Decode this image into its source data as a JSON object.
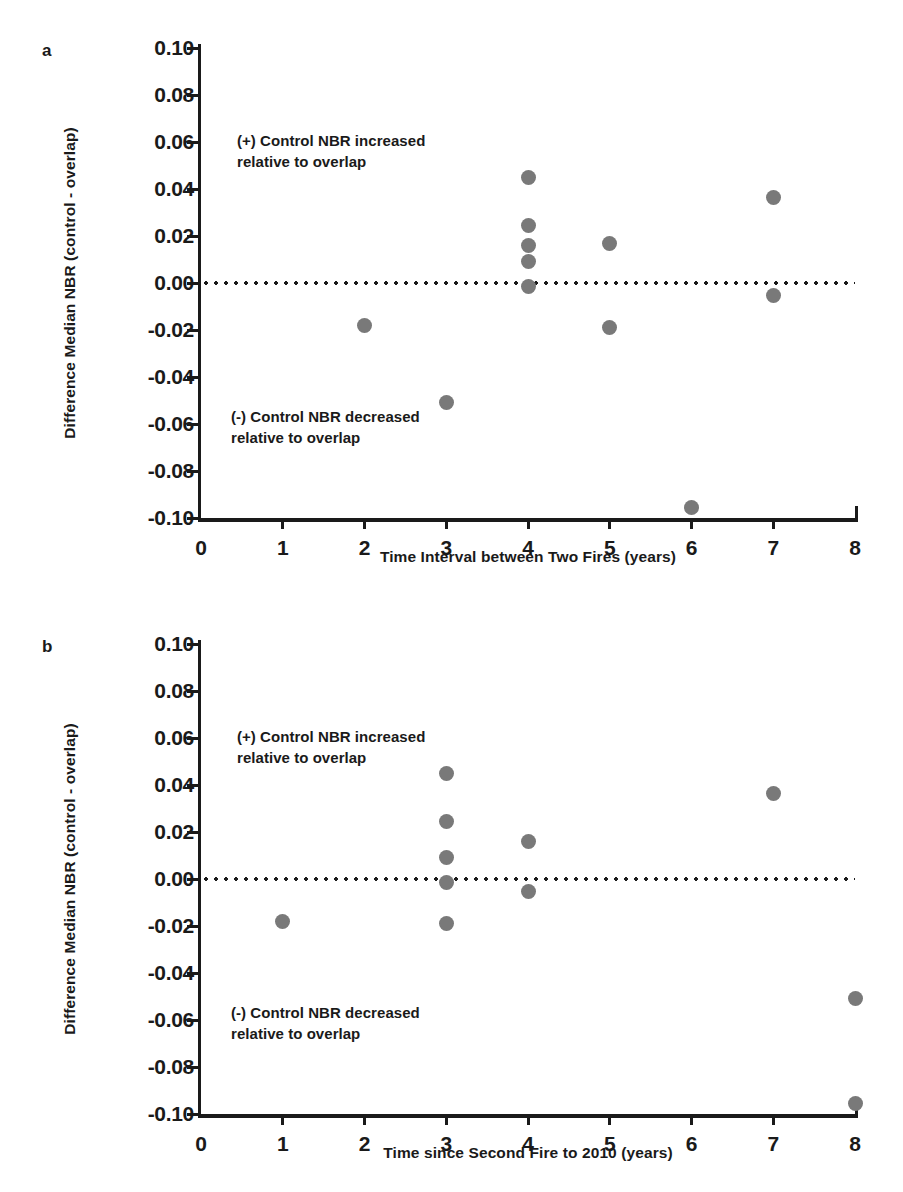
{
  "figure": {
    "background": "#ffffff",
    "dot_color": "#797979",
    "axis_color": "#1a1a1a"
  },
  "panels": [
    {
      "letter": "a",
      "annotation_positive": "(+) Control NBR increased\nrelative to overlap",
      "annotation_negative": "(-) Control NBR decreased\nrelative to overlap"
    },
    {
      "letter": "b",
      "annotation_positive": "(+) Control NBR increased\nrelative to overlap",
      "annotation_negative": "(-) Control NBR decreased\nrelative to overlap"
    }
  ],
  "caption_sliver": "",
  "chart_data": [
    {
      "type": "scatter",
      "panel": "a",
      "title": "",
      "xlabel": "Time Interval between Two Fires (years)",
      "ylabel": "Difference  Median  NBR (control - overlap)",
      "xlim": [
        0,
        8
      ],
      "ylim": [
        -0.1,
        0.1
      ],
      "xticks": [
        "0",
        "1",
        "2",
        "3",
        "4",
        "5",
        "6",
        "7",
        "8"
      ],
      "yticks": [
        "0.10",
        "0.08",
        "0.06",
        "0.04",
        "0.02",
        "0.00",
        "-0.02",
        "-0.04",
        "-0.06",
        "-0.08",
        "-0.10"
      ],
      "grid": false,
      "legend": "none",
      "reference_line": {
        "y": 0.0,
        "style": "dotted"
      },
      "points": [
        {
          "x": 2,
          "y": -0.018
        },
        {
          "x": 3,
          "y": -0.051
        },
        {
          "x": 4,
          "y": 0.045
        },
        {
          "x": 4,
          "y": 0.0245
        },
        {
          "x": 4,
          "y": 0.016
        },
        {
          "x": 4,
          "y": 0.009
        },
        {
          "x": 4,
          "y": -0.0015
        },
        {
          "x": 5,
          "y": 0.017
        },
        {
          "x": 5,
          "y": -0.019
        },
        {
          "x": 6,
          "y": -0.0955
        },
        {
          "x": 7,
          "y": 0.0365
        },
        {
          "x": 7,
          "y": -0.0055
        }
      ]
    },
    {
      "type": "scatter",
      "panel": "b",
      "title": "",
      "xlabel": "Time since Second Fire to 2010 (years)",
      "ylabel": "Difference  Median  NBR (control - overlap)",
      "xlim": [
        0,
        8
      ],
      "ylim": [
        -0.1,
        0.1
      ],
      "xticks": [
        "0",
        "1",
        "2",
        "3",
        "4",
        "5",
        "6",
        "7",
        "8"
      ],
      "yticks": [
        "0.10",
        "0.08",
        "0.06",
        "0.04",
        "0.02",
        "0.00",
        "-0.02",
        "-0.04",
        "-0.06",
        "-0.08",
        "-0.10"
      ],
      "grid": false,
      "legend": "none",
      "reference_line": {
        "y": 0.0,
        "style": "dotted"
      },
      "points": [
        {
          "x": 1,
          "y": -0.018
        },
        {
          "x": 3,
          "y": 0.045
        },
        {
          "x": 3,
          "y": 0.0245
        },
        {
          "x": 3,
          "y": 0.009
        },
        {
          "x": 3,
          "y": -0.0015
        },
        {
          "x": 3,
          "y": -0.019
        },
        {
          "x": 4,
          "y": 0.016
        },
        {
          "x": 4,
          "y": -0.0055
        },
        {
          "x": 7,
          "y": 0.0365
        },
        {
          "x": 8,
          "y": -0.051
        },
        {
          "x": 8,
          "y": -0.0955
        }
      ]
    }
  ]
}
